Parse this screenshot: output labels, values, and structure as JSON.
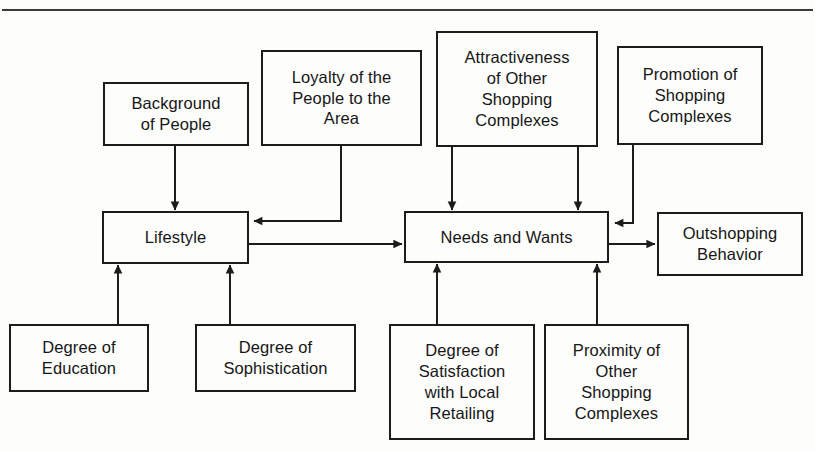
{
  "figure": {
    "type": "flow-diagram",
    "title_rule": "horizontal-rule",
    "background_color": "#fdfdfc",
    "line_color": "#1c1c1c"
  },
  "nodes": {
    "background_of_people": {
      "label": "Background\nof People"
    },
    "loyalty": {
      "label": "Loyalty of the\nPeople to the\nArea"
    },
    "attractiveness": {
      "label": "Attractiveness\nof Other\nShopping\nComplexes"
    },
    "promotion": {
      "label": "Promotion of\nShopping\nComplexes"
    },
    "lifestyle": {
      "label": "Lifestyle"
    },
    "needs_and_wants": {
      "label": "Needs and Wants"
    },
    "outshopping_behavior": {
      "label": "Outshopping\nBehavior"
    },
    "degree_of_education": {
      "label": "Degree of\nEducation"
    },
    "degree_of_sophistication": {
      "label": "Degree of\nSophistication"
    },
    "degree_of_satisfaction": {
      "label": "Degree of\nSatisfaction\nwith Local\nRetailing"
    },
    "proximity": {
      "label": "Proximity of\nOther\nShopping\nComplexes"
    }
  },
  "edges": [
    {
      "from": "background_of_people",
      "to": "lifestyle",
      "direction": "down"
    },
    {
      "from": "degree_of_education",
      "to": "lifestyle",
      "direction": "up"
    },
    {
      "from": "degree_of_sophistication",
      "to": "lifestyle",
      "direction": "up"
    },
    {
      "from": "loyalty",
      "to": "lifestyle",
      "direction": "left"
    },
    {
      "from": "lifestyle",
      "to": "needs_and_wants",
      "direction": "right"
    },
    {
      "from": "attractiveness",
      "to": "needs_and_wants",
      "direction": "down"
    },
    {
      "from": "attractiveness",
      "to": "needs_and_wants",
      "direction": "down"
    },
    {
      "from": "promotion",
      "to": "needs_and_wants",
      "direction": "left"
    },
    {
      "from": "degree_of_satisfaction",
      "to": "needs_and_wants",
      "direction": "up"
    },
    {
      "from": "proximity",
      "to": "needs_and_wants",
      "direction": "up"
    },
    {
      "from": "needs_and_wants",
      "to": "outshopping_behavior",
      "direction": "right"
    }
  ]
}
